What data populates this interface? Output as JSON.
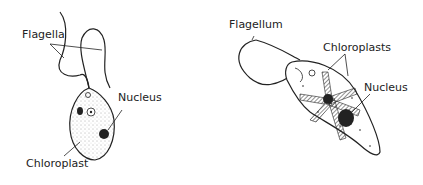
{
  "diagram": {
    "left_cell": {
      "labels": {
        "flagella": "Flagella",
        "nucleus": "Nucleus",
        "chloroplast": "Chloroplast"
      }
    },
    "right_cell": {
      "labels": {
        "flagellum": "Flagellum",
        "chloroplasts": "Chloroplasts",
        "nucleus": "Nucleus"
      }
    },
    "colors": {
      "ink": "#222222",
      "background": "#ffffff"
    }
  }
}
